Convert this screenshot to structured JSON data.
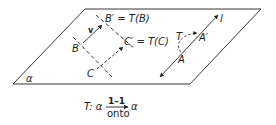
{
  "diagram": {
    "plane_label": "α",
    "points": {
      "B_prime_label": "B′ = T(B)",
      "B_label": "B",
      "C_prime_label": "C′ = T(C)",
      "C_label": "C",
      "A_label": "A",
      "A_prime_label": "A′",
      "T_label": "T",
      "line_label": "l",
      "vector_label": "v"
    },
    "caption": {
      "prefix": "T: α",
      "over": "1–1",
      "under": "onto",
      "suffix": "α"
    },
    "colors": {
      "stroke": "#222222",
      "background": "#ffffff"
    }
  }
}
